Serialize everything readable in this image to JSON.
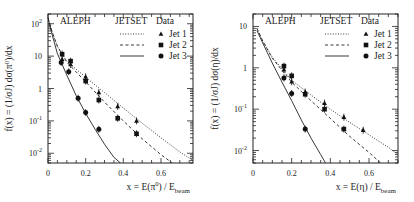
{
  "chart_data": [
    {
      "type": "scatter",
      "title": "",
      "header_labels": [
        "ALEPH",
        "JETSET",
        "Data"
      ],
      "xlabel": "x = E(π⁰) / E_beam",
      "xlabel_parts": {
        "main": "x = E(π",
        "sup": "0",
        "mid": ") / E",
        "sub": "beam"
      },
      "ylabel": "f(x) = (1/σ_J) dσ(π⁰)/dx",
      "xlim": [
        0,
        0.77
      ],
      "ylim": [
        0.005,
        200
      ],
      "yscale": "log",
      "xticks": [
        0,
        0.2,
        0.4,
        0.6
      ],
      "xtick_labels": [
        "0",
        "0.2",
        "0.4",
        "0.6"
      ],
      "yticks": [
        100,
        10,
        1,
        0.1,
        0.01
      ],
      "ytick_labels": [
        {
          "base": "10",
          "exp": "2"
        },
        {
          "base": "10",
          "exp": ""
        },
        {
          "base": "1",
          "exp": ""
        },
        {
          "base": "10",
          "exp": "-1"
        },
        {
          "base": "10",
          "exp": "-2"
        }
      ],
      "legend": {
        "position": "top-right",
        "entries": [
          {
            "label": "Jet 1",
            "line": "dotted",
            "marker": "triangle"
          },
          {
            "label": "Jet 2",
            "line": "dashed",
            "marker": "square"
          },
          {
            "label": "Jet 3",
            "line": "solid",
            "marker": "circle"
          }
        ]
      },
      "series": [
        {
          "name": "Jet 1",
          "marker": "triangle",
          "points": [
            [
              0.075,
              8.0
            ],
            [
              0.12,
              5.5
            ],
            [
              0.2,
              2.3
            ],
            [
              0.27,
              0.75
            ],
            [
              0.37,
              0.28
            ],
            [
              0.47,
              0.1
            ]
          ],
          "curve": [
            [
              0.0,
              150
            ],
            [
              0.02,
              60
            ],
            [
              0.05,
              20
            ],
            [
              0.1,
              7
            ],
            [
              0.2,
              2.2
            ],
            [
              0.3,
              0.75
            ],
            [
              0.4,
              0.25
            ],
            [
              0.5,
              0.085
            ],
            [
              0.6,
              0.03
            ],
            [
              0.7,
              0.011
            ],
            [
              0.77,
              0.006
            ]
          ]
        },
        {
          "name": "Jet 2",
          "marker": "square",
          "points": [
            [
              0.075,
              11.5
            ],
            [
              0.12,
              7.0
            ],
            [
              0.2,
              1.7
            ],
            [
              0.27,
              0.44
            ],
            [
              0.37,
              0.12
            ],
            [
              0.47,
              0.04
            ]
          ],
          "curve": [
            [
              0.0,
              150
            ],
            [
              0.02,
              60
            ],
            [
              0.05,
              20
            ],
            [
              0.1,
              6.5
            ],
            [
              0.2,
              1.6
            ],
            [
              0.3,
              0.38
            ],
            [
              0.4,
              0.1
            ],
            [
              0.5,
              0.028
            ],
            [
              0.6,
              0.009
            ],
            [
              0.66,
              0.005
            ]
          ]
        },
        {
          "name": "Jet 3",
          "marker": "circle",
          "points": [
            [
              0.07,
              6.4
            ],
            [
              0.11,
              3.3
            ],
            [
              0.16,
              0.5
            ],
            [
              0.2,
              0.18
            ],
            [
              0.27,
              0.055
            ]
          ],
          "curve": [
            [
              0.0,
              150
            ],
            [
              0.02,
              50
            ],
            [
              0.05,
              12
            ],
            [
              0.1,
              2.6
            ],
            [
              0.15,
              0.6
            ],
            [
              0.2,
              0.17
            ],
            [
              0.25,
              0.055
            ],
            [
              0.3,
              0.019
            ],
            [
              0.35,
              0.0075
            ],
            [
              0.385,
              0.005
            ]
          ]
        }
      ]
    },
    {
      "type": "scatter",
      "title": "",
      "header_labels": [
        "ALEPH",
        "JETSET",
        "Data"
      ],
      "xlabel": "x = E(η) / E_beam",
      "xlabel_parts": {
        "main": "x = E(η",
        "sup": "",
        "mid": ") / E",
        "sub": "beam"
      },
      "ylabel": "f(x) = (1/σ_J) dσ(η)/dx",
      "xlim": [
        0,
        0.75
      ],
      "ylim": [
        0.005,
        20
      ],
      "yscale": "log",
      "xticks": [
        0,
        0.2,
        0.4,
        0.6
      ],
      "xtick_labels": [
        "0",
        "0.2",
        "0.4",
        "0.6"
      ],
      "yticks": [
        10,
        1,
        0.1,
        0.01
      ],
      "ytick_labels": [
        {
          "base": "10",
          "exp": ""
        },
        {
          "base": "1",
          "exp": ""
        },
        {
          "base": "10",
          "exp": "-1"
        },
        {
          "base": "10",
          "exp": "-2"
        }
      ],
      "legend": {
        "position": "top-right",
        "entries": [
          {
            "label": "Jet 1",
            "line": "dotted",
            "marker": "triangle"
          },
          {
            "label": "Jet 2",
            "line": "dashed",
            "marker": "square"
          },
          {
            "label": "Jet 3",
            "line": "solid",
            "marker": "circle"
          }
        ]
      },
      "series": [
        {
          "name": "Jet 1",
          "marker": "triangle",
          "points": [
            [
              0.16,
              0.9
            ],
            [
              0.2,
              0.46
            ],
            [
              0.27,
              0.26
            ],
            [
              0.37,
              0.14
            ],
            [
              0.47,
              0.064
            ],
            [
              0.57,
              0.031
            ]
          ],
          "curve": [
            [
              0.02,
              9
            ],
            [
              0.05,
              4.5
            ],
            [
              0.1,
              1.8
            ],
            [
              0.2,
              0.5
            ],
            [
              0.3,
              0.22
            ],
            [
              0.4,
              0.1
            ],
            [
              0.5,
              0.048
            ],
            [
              0.6,
              0.024
            ],
            [
              0.7,
              0.012
            ],
            [
              0.75,
              0.008
            ]
          ]
        },
        {
          "name": "Jet 2",
          "marker": "square",
          "points": [
            [
              0.16,
              1.1
            ],
            [
              0.2,
              0.64
            ],
            [
              0.27,
              0.23
            ],
            [
              0.37,
              0.1
            ],
            [
              0.47,
              0.033
            ]
          ],
          "curve": [
            [
              0.02,
              9
            ],
            [
              0.05,
              4.5
            ],
            [
              0.1,
              1.7
            ],
            [
              0.2,
              0.45
            ],
            [
              0.3,
              0.16
            ],
            [
              0.4,
              0.06
            ],
            [
              0.5,
              0.022
            ],
            [
              0.6,
              0.009
            ],
            [
              0.66,
              0.005
            ]
          ]
        },
        {
          "name": "Jet 3",
          "marker": "circle",
          "points": [
            [
              0.16,
              0.57
            ],
            [
              0.2,
              0.24
            ],
            [
              0.27,
              0.033
            ]
          ],
          "curve": [
            [
              0.02,
              8
            ],
            [
              0.05,
              4
            ],
            [
              0.1,
              1.3
            ],
            [
              0.15,
              0.45
            ],
            [
              0.2,
              0.16
            ],
            [
              0.25,
              0.055
            ],
            [
              0.3,
              0.02
            ],
            [
              0.35,
              0.008
            ],
            [
              0.375,
              0.005
            ]
          ]
        }
      ]
    }
  ]
}
